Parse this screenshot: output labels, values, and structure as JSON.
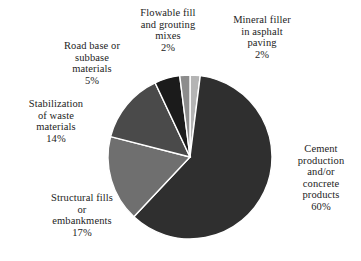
{
  "chart_data": {
    "type": "pie",
    "title": "",
    "unit": "%",
    "legend_position": "outside-labels",
    "categories": [
      "Mineral filler in asphalt paving",
      "Cement production and/or concrete products",
      "Structural fills or embankments",
      "Stabilization of waste materials",
      "Road base or subbase materials",
      "Flowable fill and grouting mixes"
    ],
    "values": [
      2,
      60,
      17,
      14,
      5,
      2
    ],
    "start_angle_deg": 0,
    "direction": "clockwise",
    "slices": [
      {
        "name": "mineral-filler",
        "value": 2,
        "color": "#b4b4b4",
        "start_deg": 0,
        "end_deg": 7.2
      },
      {
        "name": "cement-production",
        "value": 60,
        "color": "#2f2f2f",
        "start_deg": 7.2,
        "end_deg": 223.2
      },
      {
        "name": "structural-fills",
        "value": 17,
        "color": "#6f6f6f",
        "start_deg": 223.2,
        "end_deg": 284.4
      },
      {
        "name": "stabilization-waste",
        "value": 14,
        "color": "#4a4a4a",
        "start_deg": 284.4,
        "end_deg": 334.8
      },
      {
        "name": "road-base",
        "value": 5,
        "color": "#1b1b1b",
        "start_deg": 334.8,
        "end_deg": 352.8
      },
      {
        "name": "flowable-fill",
        "value": 2,
        "color": "#8c8c8c",
        "start_deg": 352.8,
        "end_deg": 360
      }
    ],
    "geometry": {
      "cx": 190,
      "cy": 157,
      "r": 82
    },
    "colors": {
      "background": "#ffffff",
      "slice_border": "#ffffff",
      "text": "#232323"
    }
  },
  "labels": {
    "flowable_fill": {
      "line1": "Flowable fill",
      "line2": "and grouting",
      "line3": "mixes",
      "pct": "2%"
    },
    "mineral_filler": {
      "line1": "Mineral filler",
      "line2": "in asphalt",
      "line3": "paving",
      "pct": "2%"
    },
    "road_base": {
      "line1": "Road base or",
      "line2": "subbase",
      "line3": "materials",
      "pct": "5%"
    },
    "stabilization": {
      "line1": "Stabilization",
      "line2": "of waste",
      "line3": "materials",
      "pct": "14%"
    },
    "structural_fills": {
      "line1": "Structural fills",
      "line2": "or",
      "line3": "embankments",
      "pct": "17%"
    },
    "cement_production": {
      "line1": "Cement",
      "line2": "production",
      "line3": "and/or",
      "line4": "concrete",
      "line5": "products",
      "pct": "60%"
    }
  }
}
